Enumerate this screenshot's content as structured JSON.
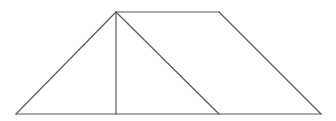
{
  "diagram": {
    "type": "geometry-figure",
    "stroke_color": "#5a5a5a",
    "stroke_width": 1.2,
    "background": "#ffffff",
    "points": {
      "bottom_left": [
        16,
        114
      ],
      "top_left": [
        116,
        12
      ],
      "altitude_foot": [
        116,
        114
      ],
      "top_right": [
        219,
        12
      ],
      "diagonal_foot": [
        219,
        114
      ],
      "bottom_right": [
        321,
        114
      ]
    },
    "segments": [
      {
        "name": "base",
        "from": "bottom_left",
        "to": "bottom_right"
      },
      {
        "name": "left-side",
        "from": "bottom_left",
        "to": "top_left"
      },
      {
        "name": "top-side",
        "from": "top_left",
        "to": "top_right"
      },
      {
        "name": "right-side",
        "from": "top_right",
        "to": "bottom_right"
      },
      {
        "name": "altitude",
        "from": "top_left",
        "to": "altitude_foot"
      },
      {
        "name": "diagonal",
        "from": "top_left",
        "to": "diagonal_foot"
      }
    ]
  }
}
